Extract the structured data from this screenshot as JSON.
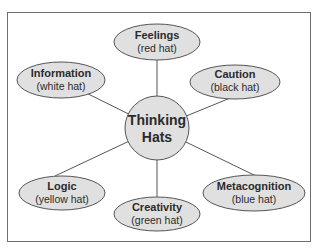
{
  "diagram": {
    "type": "hub-and-spoke",
    "colors": {
      "node_fill": "#e0e0e0",
      "node_stroke": "#555555",
      "line": "#555555",
      "frame": "#6e6e6e",
      "text": "#2b2b2b"
    },
    "center": {
      "line1": "Thinking",
      "line2": "Hats"
    },
    "nodes": [
      {
        "id": "feelings",
        "title": "Feelings",
        "subtitle": "(red hat)"
      },
      {
        "id": "caution",
        "title": "Caution",
        "subtitle": "(black hat)"
      },
      {
        "id": "metacognition",
        "title": "Metacognition",
        "subtitle": "(blue hat)"
      },
      {
        "id": "creativity",
        "title": "Creativity",
        "subtitle": "(green hat)"
      },
      {
        "id": "logic",
        "title": "Logic",
        "subtitle": "(yellow hat)"
      },
      {
        "id": "information",
        "title": "Information",
        "subtitle": "(white hat)"
      }
    ]
  }
}
